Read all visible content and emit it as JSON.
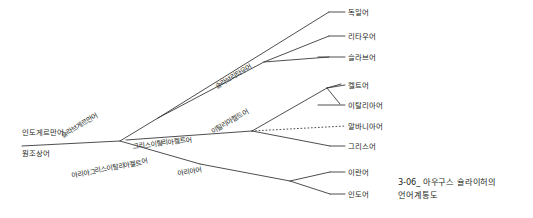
{
  "figure": {
    "caption": "3-06_ 아우구스 슐라이허의\n언어계통도",
    "line_color": "#3a3a3a",
    "text_color": "#231f20",
    "background": "#ffffff"
  },
  "root": {
    "above_label": "인도게르만어",
    "below_label": "원조상어"
  },
  "branch_labels": [
    {
      "id": "slav-germanic",
      "text": "슬라브게르만어"
    },
    {
      "id": "slav-lithuanian",
      "text": "슬라브리타우어"
    },
    {
      "id": "greek-italic-celtic",
      "text": "그리스이탈리아켈트어"
    },
    {
      "id": "italo-celtic",
      "text": "이탈리아켈트어"
    },
    {
      "id": "aryan-greek-italo-celtic",
      "text": "아리아그리스이탈리아켈트어"
    },
    {
      "id": "aryan",
      "text": "아리아어"
    }
  ],
  "leaves": [
    {
      "id": "german",
      "text": "독일어",
      "style": "solid"
    },
    {
      "id": "lithuanian",
      "text": "리타우어",
      "style": "solid"
    },
    {
      "id": "slavic",
      "text": "슬라브어",
      "style": "solid"
    },
    {
      "id": "celtic",
      "text": "켈트어",
      "style": "solid"
    },
    {
      "id": "italic",
      "text": "이탈리아어",
      "style": "solid"
    },
    {
      "id": "albanian",
      "text": "알바니아어",
      "style": "dotted"
    },
    {
      "id": "greek",
      "text": "그리스어",
      "style": "solid"
    },
    {
      "id": "iranian",
      "text": "이란어",
      "style": "solid"
    },
    {
      "id": "indic",
      "text": "인도어",
      "style": "solid"
    }
  ]
}
